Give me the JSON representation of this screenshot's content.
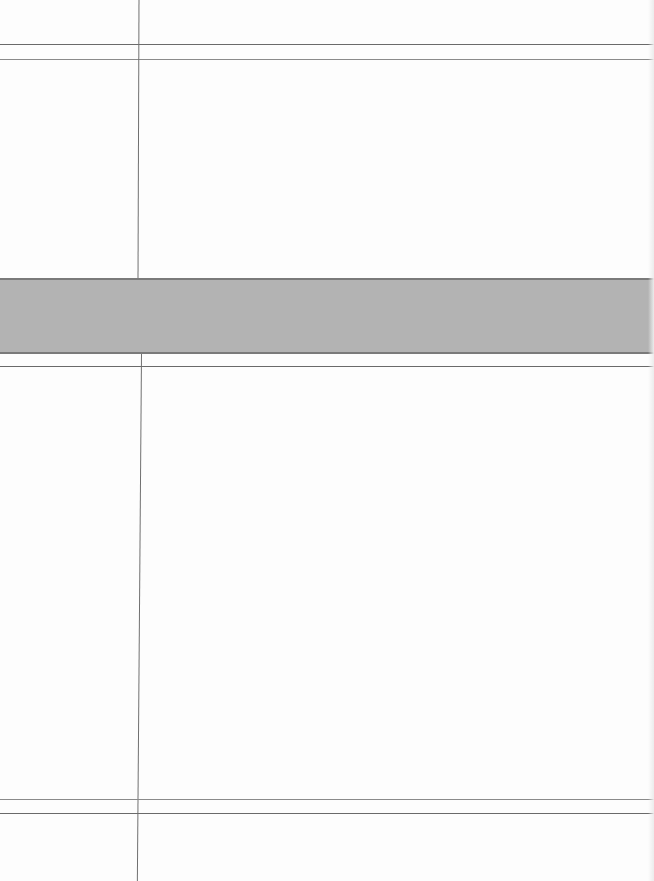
{
  "document": {
    "type": "blank ledger form",
    "width": 654,
    "height": 881
  },
  "colors": {
    "paper": "#fdfdfd",
    "rule_line": "#6a6a6a",
    "band_fill": "#b3b3b3",
    "band_border": "#7a7a7a"
  },
  "sections": [
    {
      "name": "header-row",
      "label_column": "",
      "content_column": ""
    },
    {
      "name": "upper-section",
      "label_column": "",
      "content_column": ""
    },
    {
      "name": "shaded-band",
      "text": ""
    },
    {
      "name": "lower-section",
      "label_column": "",
      "content_column": ""
    },
    {
      "name": "footer-row",
      "label_column": "",
      "content_column": ""
    }
  ]
}
